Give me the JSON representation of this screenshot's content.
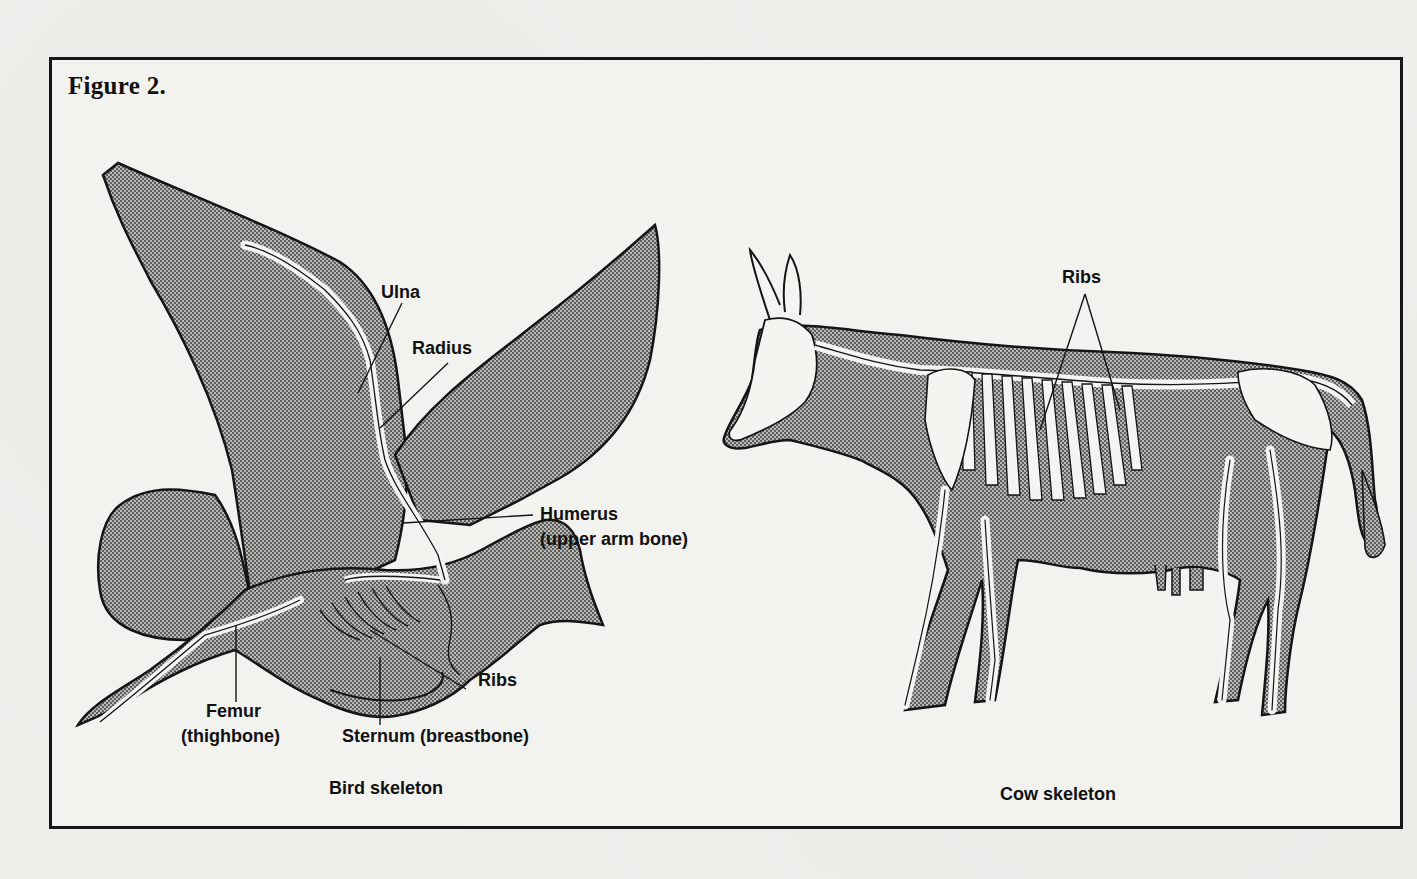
{
  "figure": {
    "title": "Figure 2.",
    "colors": {
      "frame": "#161616",
      "paper": "#f2f2ef",
      "stipple_fill": "#8a8a88",
      "bone": "#f4f4f1",
      "outline": "#151515"
    }
  },
  "bird": {
    "caption": "Bird skeleton",
    "labels": {
      "ulna": "Ulna",
      "radius": "Radius",
      "humerus": "Humerus",
      "humerus_note": "(upper arm bone)",
      "femur": "Femur",
      "femur_note": "(thighbone)",
      "sternum": "Sternum (breastbone)",
      "ribs": "Ribs"
    }
  },
  "cow": {
    "caption": "Cow skeleton",
    "labels": {
      "ribs": "Ribs"
    }
  }
}
